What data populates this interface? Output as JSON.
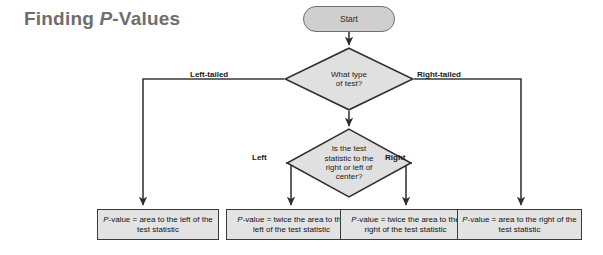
{
  "title": {
    "prefix": "Finding ",
    "italic": "P",
    "suffix": "-Values"
  },
  "nodes": {
    "start": {
      "label": "Start",
      "shape": "stadium",
      "fill": "#cfcfcf"
    },
    "decision_type": {
      "label": "What type\nof test?",
      "shape": "diamond",
      "fill": "#e0e0e0"
    },
    "decision_side": {
      "label": "Is the test\nstatistic to the\nright or left of\ncenter?",
      "shape": "diamond",
      "fill": "#e0e0e0"
    }
  },
  "edge_labels": {
    "left_tailed": "Left-tailed",
    "right_tailed": "Right-tailed",
    "left": "Left",
    "right": "Right"
  },
  "results": [
    {
      "id": "left-tail",
      "italic": "P",
      "text": "-value = area to the left of the test statistic"
    },
    {
      "id": "two-left",
      "italic": "P",
      "text": "-value = twice the area to the left of the test statistic"
    },
    {
      "id": "two-right",
      "italic": "P",
      "text": "-value = twice the area to the right of the test statistic"
    },
    {
      "id": "right-tail",
      "italic": "P",
      "text": "-value = area to the right of the test statistic"
    }
  ],
  "colors": {
    "node_fill": "#e0e0e0",
    "start_fill": "#cfcfcf",
    "box_fill": "#e3e3e3",
    "line": "#3a3a3a",
    "title": "#6e6e6e",
    "background": "#ffffff"
  }
}
